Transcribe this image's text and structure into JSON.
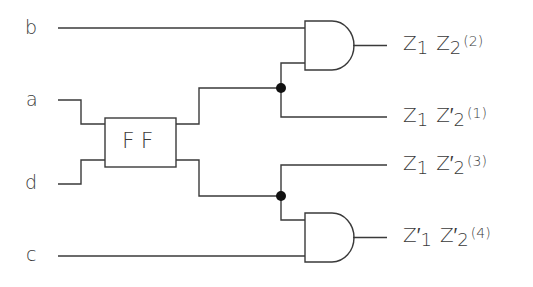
{
  "diagram": {
    "title": "",
    "colors": {
      "wire": "#3a3a3a",
      "junction": "#111111",
      "background": "#ffffff"
    },
    "inputs": [
      {
        "id": "b",
        "label": "b"
      },
      {
        "id": "a",
        "label": "a"
      },
      {
        "id": "d",
        "label": "d"
      },
      {
        "id": "c",
        "label": "c"
      }
    ],
    "block": {
      "id": "ff",
      "label": "FF",
      "type": "flip-flop"
    },
    "gates": [
      {
        "id": "and-top",
        "type": "AND",
        "inputs": [
          "b",
          "ff-out-upper"
        ]
      },
      {
        "id": "and-bottom",
        "type": "AND",
        "inputs": [
          "ff-out-lower",
          "c"
        ]
      }
    ],
    "outputs": [
      {
        "id": "out-2",
        "z1": "Z",
        "z1_sub": "1",
        "z1_prime": "",
        "z2": "Z",
        "z2_sub": "2",
        "z2_prime": "",
        "index": "(2)",
        "source": "and-top"
      },
      {
        "id": "out-1",
        "z1": "Z",
        "z1_sub": "1",
        "z1_prime": "",
        "z2": "Z′",
        "z2_sub": "2",
        "z2_prime": "′",
        "index": "(1)",
        "source": "junction-upper"
      },
      {
        "id": "out-3",
        "z1": "Z",
        "z1_sub": "1",
        "z1_prime": "",
        "z2": "Z′",
        "z2_sub": "2",
        "z2_prime": "′",
        "index": "(3)",
        "source": "junction-lower"
      },
      {
        "id": "out-4",
        "z1": "Z′",
        "z1_sub": "1",
        "z1_prime": "′",
        "z2": "Z′",
        "z2_sub": "2",
        "z2_prime": "′",
        "index": "(4)",
        "source": "and-bottom"
      }
    ],
    "junctions": [
      {
        "id": "junction-upper"
      },
      {
        "id": "junction-lower"
      }
    ]
  }
}
